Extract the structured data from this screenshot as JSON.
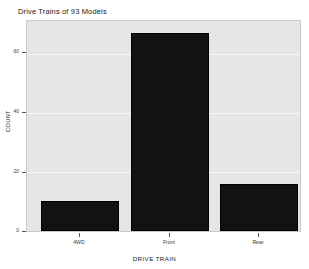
{
  "chart_data": {
    "type": "bar",
    "title": "Drive Trains of 93 Models",
    "xlabel": "DRIVE TRAIN",
    "ylabel": "COUNT",
    "categories": [
      "4WD",
      "Front",
      "Rear"
    ],
    "values": [
      10,
      67,
      16
    ],
    "ylim": [
      0,
      71
    ],
    "yticks": [
      0,
      20,
      40,
      60
    ],
    "ytick_labels": [
      "0",
      "20",
      "40",
      "60"
    ],
    "grid": true,
    "legend": "none",
    "series": [
      {
        "name": "COUNT",
        "values": [
          10,
          67,
          16
        ]
      }
    ],
    "bar_color": "#121212",
    "panel_background": "#e6e6e6",
    "gridline_color": "#f7f7f7"
  }
}
